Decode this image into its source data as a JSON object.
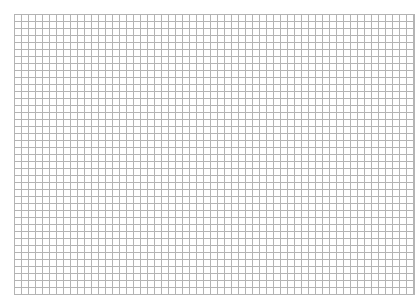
{
  "sheet": {
    "type": "graph-paper",
    "grid_color": "#b4b4b4",
    "background_color": "#ffffff",
    "cell_size_px": 7
  }
}
